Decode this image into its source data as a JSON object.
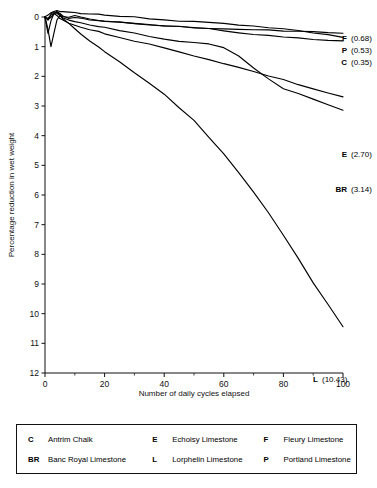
{
  "chart_data": {
    "type": "line",
    "title": "",
    "xlabel": "Number of daily cycles elapsed",
    "ylabel": "Percentage reduction in wet weight",
    "xlim": [
      0,
      100
    ],
    "ylim": [
      0,
      12
    ],
    "y_inverted": true,
    "grid": false,
    "legend_position": "bottom-box",
    "xticks": [
      0,
      20,
      40,
      60,
      80,
      100
    ],
    "xtick_labels": [
      "0",
      "20",
      "40",
      "60",
      "80",
      "100"
    ],
    "x_minor_ticks": [
      10,
      30,
      50,
      70,
      90
    ],
    "yticks": [
      0,
      1,
      2,
      3,
      4,
      5,
      6,
      7,
      8,
      9,
      10,
      11,
      12
    ],
    "ytick_labels": [
      "0",
      "1",
      "2",
      "3",
      "4",
      "5",
      "6",
      "7",
      "8",
      "9",
      "10",
      "11",
      "12"
    ],
    "line_color": "#000000",
    "series": [
      {
        "name": "F",
        "code": "F",
        "label": "Fleury Limestone",
        "end_value": 0.68,
        "end_label": "(0.68)",
        "x": [
          0,
          1,
          2,
          3,
          4,
          5,
          6,
          8,
          10,
          12,
          15,
          18,
          20,
          25,
          30,
          35,
          40,
          45,
          50,
          55,
          60,
          65,
          70,
          75,
          80,
          85,
          90,
          95,
          100
        ],
        "values": [
          0,
          -0.08,
          -0.14,
          -0.19,
          -0.21,
          -0.2,
          -0.18,
          -0.16,
          -0.15,
          -0.13,
          -0.11,
          -0.09,
          -0.07,
          -0.03,
          0.01,
          0.05,
          0.09,
          0.13,
          0.16,
          0.19,
          0.22,
          0.26,
          0.3,
          0.35,
          0.4,
          0.46,
          0.53,
          0.61,
          0.68
        ]
      },
      {
        "name": "P",
        "code": "P",
        "label": "Portland Limestone",
        "end_value": 0.53,
        "end_label": "(0.53)",
        "x": [
          0,
          1,
          2,
          3,
          4,
          5,
          6,
          8,
          10,
          12,
          15,
          18,
          20,
          25,
          30,
          35,
          40,
          45,
          50,
          55,
          60,
          65,
          70,
          75,
          80,
          85,
          90,
          95,
          100
        ],
        "values": [
          0,
          0.1,
          -0.1,
          -0.18,
          -0.12,
          -0.05,
          0.0,
          0.02,
          -0.05,
          0.0,
          0.06,
          0.1,
          0.13,
          0.18,
          0.22,
          0.26,
          0.3,
          0.33,
          0.36,
          0.38,
          0.4,
          0.42,
          0.44,
          0.45,
          0.47,
          0.48,
          0.5,
          0.51,
          0.53
        ]
      },
      {
        "name": "C",
        "code": "C",
        "label": "Antrim Chalk",
        "end_value": 0.35,
        "end_label": "(0.35)",
        "x": [
          0,
          1,
          2,
          3,
          4,
          5,
          6,
          8,
          10,
          12,
          15,
          18,
          20,
          25,
          30,
          35,
          40,
          45,
          50,
          55,
          60,
          65,
          70,
          75,
          80,
          85,
          90,
          95,
          100
        ],
        "values": [
          0,
          0.55,
          0.12,
          -0.12,
          -0.18,
          -0.1,
          -0.02,
          0.03,
          0.02,
          0.05,
          0.09,
          0.12,
          0.14,
          0.18,
          0.22,
          0.26,
          0.3,
          0.33,
          0.36,
          0.4,
          0.46,
          0.52,
          0.58,
          0.62,
          0.66,
          0.7,
          0.74,
          0.78,
          0.82
        ]
      },
      {
        "name": "E",
        "code": "E",
        "label": "Echoisy Limestone",
        "end_value": 2.7,
        "end_label": "(2.70)",
        "x": [
          0,
          1,
          2,
          3,
          4,
          5,
          6,
          8,
          10,
          12,
          15,
          18,
          20,
          25,
          30,
          35,
          40,
          45,
          50,
          55,
          60,
          65,
          70,
          75,
          80,
          85,
          90,
          95,
          100
        ],
        "values": [
          0,
          0.05,
          -0.05,
          -0.12,
          -0.05,
          0.05,
          0.12,
          0.2,
          0.28,
          0.34,
          0.42,
          0.5,
          0.55,
          0.68,
          0.8,
          0.92,
          1.05,
          1.18,
          1.3,
          1.43,
          1.56,
          1.7,
          1.84,
          1.98,
          2.12,
          2.27,
          2.42,
          2.56,
          2.7
        ]
      },
      {
        "name": "BR",
        "code": "BR",
        "label": "Banc Royal Limestone",
        "end_value": 3.14,
        "end_label": "(3.14)",
        "x": [
          0,
          1,
          2,
          3,
          4,
          5,
          6,
          8,
          10,
          12,
          15,
          18,
          20,
          25,
          30,
          35,
          40,
          45,
          50,
          55,
          60,
          65,
          70,
          75,
          80,
          85,
          90,
          95,
          100
        ],
        "values": [
          0,
          0.1,
          0.02,
          -0.1,
          -0.16,
          -0.08,
          0.02,
          0.1,
          0.16,
          0.2,
          0.26,
          0.32,
          0.36,
          0.46,
          0.55,
          0.65,
          0.76,
          0.82,
          0.86,
          0.92,
          1.05,
          1.3,
          1.7,
          2.1,
          2.42,
          2.56,
          2.78,
          2.96,
          3.14
        ]
      },
      {
        "name": "L",
        "code": "L",
        "label": "Lorphelin Limestone",
        "end_value": 10.43,
        "end_label": "(10.43)",
        "x": [
          0,
          1,
          2,
          3,
          4,
          5,
          6,
          8,
          10,
          12,
          15,
          18,
          20,
          25,
          30,
          35,
          40,
          45,
          50,
          55,
          60,
          65,
          70,
          75,
          80,
          85,
          90,
          95,
          100
        ],
        "values": [
          0,
          0.4,
          1.0,
          0.55,
          0.1,
          -0.05,
          0.05,
          0.22,
          0.4,
          0.56,
          0.8,
          1.02,
          1.18,
          1.52,
          1.88,
          2.25,
          2.62,
          3.05,
          3.5,
          4.05,
          4.62,
          5.25,
          5.9,
          6.6,
          7.35,
          8.15,
          8.95,
          9.7,
          10.43
        ]
      }
    ],
    "end_labels": [
      {
        "code": "F",
        "value": "(0.68)"
      },
      {
        "code": "P",
        "value": "(0.53)"
      },
      {
        "code": "C",
        "value": "(0.35)"
      },
      {
        "code": "E",
        "value": "(2.70)"
      },
      {
        "code": "BR",
        "value": "(3.14)"
      },
      {
        "code": "L",
        "value": "(10.43)"
      }
    ]
  },
  "legend": {
    "entries": [
      {
        "code": "C",
        "label": "Antrim Chalk"
      },
      {
        "code": "E",
        "label": "Echoisy Limestone"
      },
      {
        "code": "F",
        "label": "Fleury Limestone"
      },
      {
        "code": "BR",
        "label": "Banc Royal Limestone"
      },
      {
        "code": "L",
        "label": "Lorphelin Limestone"
      },
      {
        "code": "P",
        "label": "Portland Limestone"
      }
    ]
  }
}
